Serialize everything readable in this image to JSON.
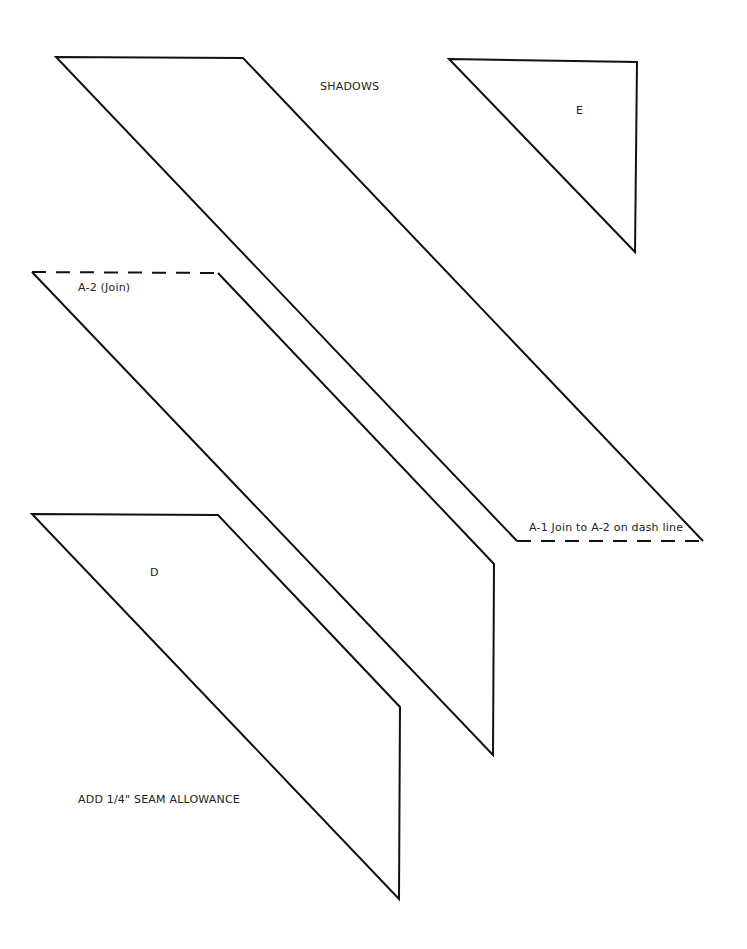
{
  "title": "SHADOWS",
  "pieces": [
    {
      "id": "A-1",
      "label": "A-1 Join to A-2 on dash line"
    },
    {
      "id": "A-2",
      "label": "A-2 (Join)"
    },
    {
      "id": "D",
      "label": "D"
    },
    {
      "id": "E",
      "label": "E"
    }
  ],
  "note": "ADD 1/4\" SEAM ALLOWANCE",
  "colors": {
    "line": "#111111",
    "background": "#ffffff"
  }
}
